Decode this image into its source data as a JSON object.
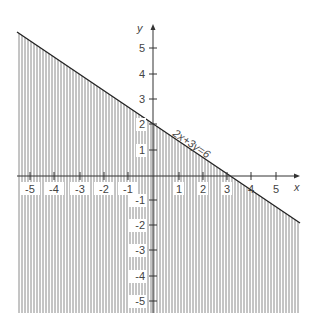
{
  "figure": {
    "type": "linear-inequality-graph",
    "inequality": "2x + 3y ≤ 6",
    "boundary_label": "2x+3y=6",
    "shading": "below line (vertical hatching)",
    "axes": {
      "x_label": "x",
      "y_label": "y",
      "x_ticks": [
        "-5",
        "-4",
        "-3",
        "-2",
        "-1",
        "1",
        "2",
        "3",
        "4",
        "5"
      ],
      "y_ticks": [
        "5",
        "4",
        "3",
        "2",
        "1",
        "-1",
        "-2",
        "-3",
        "-4",
        "-5"
      ]
    },
    "colors": {
      "line": "#222222",
      "hatch": "#8a8a8a",
      "axis": "#333333",
      "text": "#444444"
    }
  }
}
